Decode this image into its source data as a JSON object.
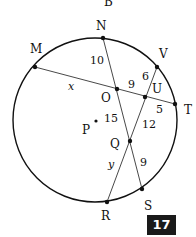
{
  "diagram": {
    "top_partial_label": "B",
    "circle": {
      "cx": 95,
      "cy": 120,
      "r": 82
    },
    "points": {
      "N": {
        "x": 103,
        "y": 38,
        "label": "N"
      },
      "M": {
        "x": 35,
        "y": 67,
        "label": "M"
      },
      "V": {
        "x": 157,
        "y": 67,
        "label": "V"
      },
      "T": {
        "x": 175,
        "y": 104,
        "label": "T"
      },
      "O": {
        "x": 117,
        "y": 89,
        "label": "O"
      },
      "U": {
        "x": 145,
        "y": 97,
        "label": "U"
      },
      "Q": {
        "x": 130,
        "y": 141,
        "label": "Q"
      },
      "S": {
        "x": 142,
        "y": 189,
        "label": "S"
      },
      "R": {
        "x": 107,
        "y": 202,
        "label": "R"
      },
      "P": {
        "x": 96,
        "y": 121,
        "label": "P"
      }
    },
    "chords": [
      "M-T",
      "N-S",
      "V-R"
    ],
    "segment_labels": {
      "NO": "10",
      "MO": "x",
      "OU": "9",
      "VU": "6",
      "UT": "5",
      "OQ": "15",
      "UQ": "12",
      "QR": "y",
      "QS": "9"
    }
  },
  "badge": {
    "label": "17"
  }
}
